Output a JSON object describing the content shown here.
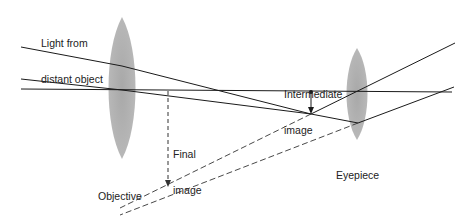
{
  "labels": {
    "light_source_line1": "Light from",
    "light_source_line2": "distant object",
    "intermediate_line1": "Intermediate",
    "intermediate_line2": "image",
    "final_line1": "Final",
    "final_line2": "image",
    "objective_line1": "Objective",
    "objective_line2": "lens",
    "eyepiece": "Eyepiece"
  },
  "colors": {
    "lens_fill": "#b0b0b0",
    "ray": "#1a1a1a",
    "dashed_ray": "#333333",
    "text": "#222222",
    "background": "#ffffff"
  },
  "components": {
    "optical_axis": {
      "x1": 21,
      "y1": 89,
      "x2": 452,
      "y2": 92
    },
    "objective_lens": {
      "cx": 122,
      "cy": 88,
      "rx": 12,
      "ry": 71
    },
    "eyepiece_lens": {
      "cx": 357,
      "cy": 94,
      "rx": 9,
      "ry": 46
    },
    "intermediate_image": {
      "x": 311,
      "y_top": 92,
      "y_tip": 114
    },
    "final_image": {
      "x": 168,
      "y_top": 91,
      "y_tip": 187
    }
  }
}
